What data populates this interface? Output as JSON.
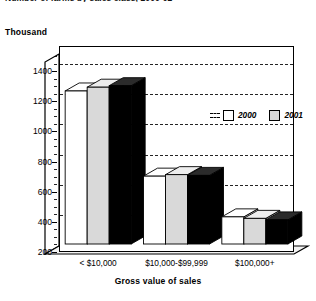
{
  "chart_data": {
    "type": "bar",
    "title": "Number of farms by sales class, 2000-02",
    "unit_label": "Thousand",
    "xlabel": "Gross value of sales",
    "ylabel": "",
    "categories": [
      "< $10,000",
      "$10,000-$99,999",
      "$100,000+"
    ],
    "series": [
      {
        "name": "2000",
        "color": "#ffffff",
        "values": [
          1215,
          650,
          380
        ]
      },
      {
        "name": "2001",
        "color": "#d9d9d9",
        "values": [
          1240,
          660,
          370
        ]
      },
      {
        "name": "2002",
        "color": "#000000",
        "values": [
          1250,
          655,
          360
        ]
      }
    ],
    "ylim": [
      200,
      1500
    ],
    "yticks": [
      200,
      400,
      600,
      800,
      1000,
      1200,
      1400
    ],
    "ytick_labels": [
      "200",
      "400",
      "600",
      "800",
      "1000",
      "1200",
      "1400"
    ],
    "grid": true,
    "grid_style": "dashed-horizontal",
    "legend_position": "top-right-inside",
    "style_3d": true
  },
  "legend": {
    "items": [
      {
        "label": "2000",
        "swatch": "white-swatch"
      },
      {
        "label": "2001",
        "swatch": "gray-swatch"
      },
      {
        "label": "2002",
        "swatch": "black-swatch"
      }
    ]
  }
}
